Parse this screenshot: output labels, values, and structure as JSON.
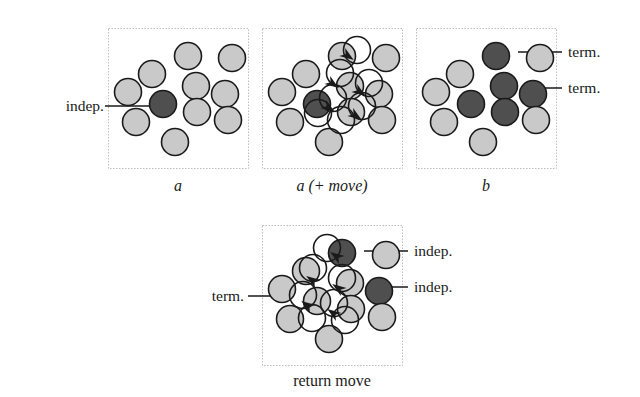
{
  "figure": {
    "background_color": "#ffffff",
    "canvas": {
      "width": 640,
      "height": 397
    }
  },
  "style": {
    "particle_light_fill": "#c9c9c9",
    "particle_dark_fill": "#4f4f4f",
    "particle_move_fill": "#ffffff",
    "particle_stroke": "#1a1a1a",
    "panel_border_color": "#bdbdbd",
    "leader_line_color": "#1a1a1a",
    "arrow_color": "#1a1a1a",
    "particle_radius": 13.5,
    "particle_stroke_width": 1.6,
    "panel_border_width": 1
  },
  "panels": [
    {
      "id": "panel-a",
      "caption": "a",
      "caption_style": "italic",
      "box": {
        "x": 108,
        "y": 28,
        "width": 140,
        "height": 140
      },
      "particles": [
        {
          "id": "a-p1",
          "cx": 188,
          "cy": 56,
          "state": "light"
        },
        {
          "id": "a-p2",
          "cx": 232,
          "cy": 58,
          "state": "light"
        },
        {
          "id": "a-p3",
          "cx": 152,
          "cy": 74,
          "state": "light"
        },
        {
          "id": "a-p4",
          "cx": 196,
          "cy": 86,
          "state": "light"
        },
        {
          "id": "a-p5",
          "cx": 225,
          "cy": 94,
          "state": "light"
        },
        {
          "id": "a-p6",
          "cx": 128,
          "cy": 92,
          "state": "light"
        },
        {
          "id": "a-p7",
          "cx": 163,
          "cy": 104,
          "state": "dark"
        },
        {
          "id": "a-p8",
          "cx": 197,
          "cy": 112,
          "state": "light"
        },
        {
          "id": "a-p9",
          "cx": 136,
          "cy": 122,
          "state": "light"
        },
        {
          "id": "a-p10",
          "cx": 228,
          "cy": 120,
          "state": "light"
        },
        {
          "id": "a-p11",
          "cx": 175,
          "cy": 142,
          "state": "light"
        }
      ],
      "move_circles": [],
      "arrows": []
    },
    {
      "id": "panel-a-move",
      "caption": "a (+ move)",
      "caption_style": "italic-mixed",
      "box": {
        "x": 262,
        "y": 28,
        "width": 140,
        "height": 140
      },
      "particles": [
        {
          "id": "m-p1",
          "cx": 342,
          "cy": 56,
          "state": "light"
        },
        {
          "id": "m-p2",
          "cx": 386,
          "cy": 58,
          "state": "light"
        },
        {
          "id": "m-p3",
          "cx": 306,
          "cy": 74,
          "state": "light"
        },
        {
          "id": "m-p4",
          "cx": 350,
          "cy": 86,
          "state": "light"
        },
        {
          "id": "m-p5",
          "cx": 379,
          "cy": 94,
          "state": "light"
        },
        {
          "id": "m-p6",
          "cx": 282,
          "cy": 92,
          "state": "light"
        },
        {
          "id": "m-p7",
          "cx": 317,
          "cy": 104,
          "state": "dark"
        },
        {
          "id": "m-p8",
          "cx": 351,
          "cy": 112,
          "state": "light"
        },
        {
          "id": "m-p9",
          "cx": 290,
          "cy": 122,
          "state": "light"
        },
        {
          "id": "m-p10",
          "cx": 382,
          "cy": 120,
          "state": "light"
        },
        {
          "id": "m-p11",
          "cx": 329,
          "cy": 142,
          "state": "light"
        }
      ],
      "move_circles": [
        {
          "id": "m-mv1",
          "cx": 357,
          "cy": 50
        },
        {
          "id": "m-mv2",
          "cx": 340,
          "cy": 73
        },
        {
          "id": "m-mv3",
          "cx": 369,
          "cy": 83
        },
        {
          "id": "m-mv4",
          "cx": 333,
          "cy": 98
        },
        {
          "id": "m-mv5",
          "cx": 362,
          "cy": 106
        },
        {
          "id": "m-mv6",
          "cx": 341,
          "cy": 120
        },
        {
          "id": "m-mv7",
          "cx": 318,
          "cy": 113
        }
      ],
      "arrows": [
        {
          "id": "m-ar1",
          "x": 348,
          "y": 56,
          "angle": 35
        },
        {
          "id": "m-ar2",
          "x": 333,
          "y": 84,
          "angle": 35
        },
        {
          "id": "m-ar3",
          "x": 360,
          "y": 92,
          "angle": 35
        },
        {
          "id": "m-ar4",
          "x": 329,
          "y": 108,
          "angle": 35
        },
        {
          "id": "m-ar5",
          "x": 356,
          "y": 116,
          "angle": 35
        }
      ]
    },
    {
      "id": "panel-b",
      "caption": "b",
      "caption_style": "italic",
      "box": {
        "x": 416,
        "y": 28,
        "width": 140,
        "height": 140
      },
      "particles": [
        {
          "id": "b-p1",
          "cx": 496,
          "cy": 56,
          "state": "dark"
        },
        {
          "id": "b-p2",
          "cx": 540,
          "cy": 58,
          "state": "light"
        },
        {
          "id": "b-p3",
          "cx": 460,
          "cy": 74,
          "state": "light"
        },
        {
          "id": "b-p4",
          "cx": 504,
          "cy": 86,
          "state": "dark"
        },
        {
          "id": "b-p5",
          "cx": 533,
          "cy": 94,
          "state": "dark"
        },
        {
          "id": "b-p6",
          "cx": 436,
          "cy": 92,
          "state": "light"
        },
        {
          "id": "b-p7",
          "cx": 471,
          "cy": 104,
          "state": "dark"
        },
        {
          "id": "b-p8",
          "cx": 505,
          "cy": 112,
          "state": "dark"
        },
        {
          "id": "b-p9",
          "cx": 444,
          "cy": 122,
          "state": "light"
        },
        {
          "id": "b-p10",
          "cx": 536,
          "cy": 120,
          "state": "light"
        },
        {
          "id": "b-p11",
          "cx": 483,
          "cy": 142,
          "state": "light"
        }
      ],
      "move_circles": [],
      "arrows": []
    },
    {
      "id": "panel-return-move",
      "caption": "return move",
      "caption_style": "roman",
      "box": {
        "x": 262,
        "y": 225,
        "width": 140,
        "height": 140
      },
      "particles": [
        {
          "id": "r-p1",
          "cx": 342,
          "cy": 253,
          "state": "dark"
        },
        {
          "id": "r-p2",
          "cx": 386,
          "cy": 255,
          "state": "light"
        },
        {
          "id": "r-p3",
          "cx": 306,
          "cy": 271,
          "state": "light"
        },
        {
          "id": "r-p4",
          "cx": 350,
          "cy": 283,
          "state": "light"
        },
        {
          "id": "r-p5",
          "cx": 379,
          "cy": 291,
          "state": "dark"
        },
        {
          "id": "r-p6",
          "cx": 282,
          "cy": 289,
          "state": "light"
        },
        {
          "id": "r-p7",
          "cx": 317,
          "cy": 301,
          "state": "light"
        },
        {
          "id": "r-p8",
          "cx": 351,
          "cy": 309,
          "state": "light"
        },
        {
          "id": "r-p9",
          "cx": 290,
          "cy": 319,
          "state": "light"
        },
        {
          "id": "r-p10",
          "cx": 382,
          "cy": 317,
          "state": "light"
        },
        {
          "id": "r-p11",
          "cx": 329,
          "cy": 339,
          "state": "light"
        }
      ],
      "move_circles": [
        {
          "id": "r-mv1",
          "cx": 327,
          "cy": 248
        },
        {
          "id": "r-mv2",
          "cx": 313,
          "cy": 268
        },
        {
          "id": "r-mv3",
          "cx": 342,
          "cy": 278
        },
        {
          "id": "r-mv4",
          "cx": 303,
          "cy": 295
        },
        {
          "id": "r-mv5",
          "cx": 334,
          "cy": 303
        },
        {
          "id": "r-mv6",
          "cx": 312,
          "cy": 318
        },
        {
          "id": "r-mv7",
          "cx": 345,
          "cy": 320
        }
      ],
      "arrows": [
        {
          "id": "r-ar1",
          "x": 336,
          "y": 256,
          "angle": 215
        },
        {
          "id": "r-ar2",
          "x": 312,
          "y": 280,
          "angle": 215
        },
        {
          "id": "r-ar3",
          "x": 338,
          "y": 288,
          "angle": 215
        },
        {
          "id": "r-ar4",
          "x": 307,
          "y": 305,
          "angle": 215
        },
        {
          "id": "r-ar5",
          "x": 333,
          "y": 313,
          "angle": 215
        }
      ]
    }
  ],
  "annotations": [
    {
      "id": "anno-indep-a",
      "text": "indep.",
      "side": "left",
      "label_x": 18,
      "label_y": 98,
      "label_width": 86,
      "leader": {
        "x1": 105,
        "y1": 106,
        "x2": 150,
        "y2": 106
      }
    },
    {
      "id": "anno-term-b-1",
      "text": "term.",
      "side": "right",
      "label_x": 568,
      "label_y": 44,
      "label_width": 64,
      "leader": {
        "x1": 518,
        "y1": 52,
        "x2": 562,
        "y2": 52
      }
    },
    {
      "id": "anno-term-b-2",
      "text": "term.",
      "side": "right",
      "label_x": 568,
      "label_y": 80,
      "label_width": 64,
      "leader": {
        "x1": 528,
        "y1": 88,
        "x2": 562,
        "y2": 88
      }
    },
    {
      "id": "anno-indep-ret-1",
      "text": "indep.",
      "side": "right",
      "label_x": 414,
      "label_y": 243,
      "label_width": 76,
      "leader": {
        "x1": 364,
        "y1": 251,
        "x2": 408,
        "y2": 251
      }
    },
    {
      "id": "anno-indep-ret-2",
      "text": "indep.",
      "side": "right",
      "label_x": 414,
      "label_y": 279,
      "label_width": 76,
      "leader": {
        "x1": 374,
        "y1": 287,
        "x2": 408,
        "y2": 287
      }
    },
    {
      "id": "anno-term-ret",
      "text": "term.",
      "side": "left",
      "label_x": 180,
      "label_y": 288,
      "label_width": 64,
      "leader": {
        "x1": 248,
        "y1": 296,
        "x2": 292,
        "y2": 296
      }
    }
  ],
  "captions": [
    {
      "id": "cap-a",
      "text": "a",
      "x": 108,
      "y": 178,
      "width": 140,
      "style": "italic"
    },
    {
      "id": "cap-a-move",
      "text": "a (+ move)",
      "x": 262,
      "y": 178,
      "width": 140,
      "style": "italic"
    },
    {
      "id": "cap-b",
      "text": "b",
      "x": 416,
      "y": 178,
      "width": 140,
      "style": "italic"
    },
    {
      "id": "cap-return",
      "text": "return move",
      "x": 262,
      "y": 373,
      "width": 140,
      "style": "roman"
    }
  ]
}
